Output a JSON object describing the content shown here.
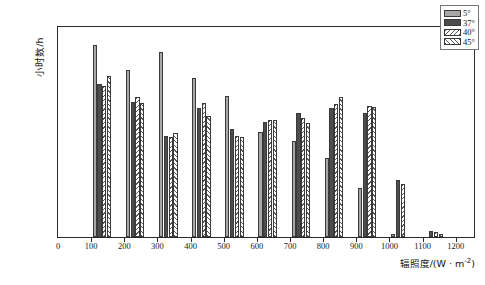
{
  "chart_data": {
    "type": "bar",
    "title": "",
    "subtitle": "",
    "xlabel": "辐照度/(W · m⁻²)",
    "ylabel": "小时数/h",
    "categories": [
      "100",
      "200",
      "300",
      "400",
      "500",
      "600",
      "700",
      "800",
      "900",
      "1000",
      "1100",
      "1200"
    ],
    "xtick_labels": [
      "0",
      "100",
      "200",
      "300",
      "400",
      "500",
      "600",
      "700",
      "800",
      "900",
      "1000",
      "1100",
      "1200"
    ],
    "ytick_labels": [
      "0",
      "100",
      "200",
      "300",
      "400",
      "500",
      "600"
    ],
    "ylim": [
      0,
      600
    ],
    "ytick_step": 100,
    "grid": false,
    "legend_position": "top-right",
    "series": [
      {
        "name": "5°",
        "fill": "#a8a8a8",
        "pattern": "solid-light-gray",
        "values": [
          550,
          478,
          530,
          453,
          403,
          300,
          273,
          225,
          140,
          10,
          0,
          0
        ]
      },
      {
        "name": "37°",
        "fill": "#4d4d4d",
        "pattern": "solid-dark-gray",
        "values": [
          437,
          385,
          290,
          368,
          308,
          330,
          355,
          370,
          353,
          162,
          18,
          0
        ]
      },
      {
        "name": "40°",
        "fill": "#f2f2f2",
        "pattern": "hatch-forward",
        "values": [
          432,
          400,
          285,
          383,
          288,
          333,
          340,
          380,
          373,
          152,
          15,
          0
        ]
      },
      {
        "name": "45°",
        "fill": "#f2f2f2",
        "pattern": "hatch-backward",
        "values": [
          460,
          382,
          296,
          345,
          287,
          335,
          325,
          400,
          372,
          0,
          8,
          0
        ]
      }
    ]
  },
  "axes": {
    "y_title": "小时数/h",
    "x_title_main": "辐照度/(W · m",
    "x_title_sup": "-2",
    "x_title_tail": ")"
  }
}
